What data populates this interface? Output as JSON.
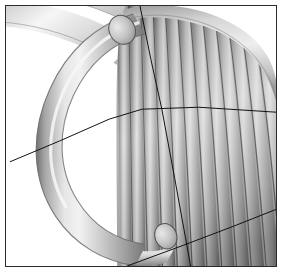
{
  "figure": {
    "render_style": "gouraud-shaded grayscale solid model",
    "background_color": "#ffffff",
    "frame_color": "#2b2b2b",
    "frame_width_px": 1,
    "image_width_px": 284,
    "image_height_px": 274,
    "caption": ""
  },
  "palette": {
    "highlight": "#f2f2f2",
    "light": "#dcdcdc",
    "mid": "#b9b9b9",
    "mid_dark": "#9c9c9c",
    "dark": "#7d7d7d",
    "shadow": "#5e5e5e",
    "groove": "#4a4a4a",
    "outline": "#3a3a3a",
    "wire": "#111111",
    "paper": "#ffffff"
  },
  "geometry": {
    "foreground_ring": {
      "name": "front-coil-turn",
      "description": "large near-circular tube turn sweeping from upper-left, around the left side and back to lower-right",
      "tube_diameter_px": 26,
      "center": {
        "x": 142,
        "y": 132
      },
      "radius_x_px": 92,
      "radius_y_px": 110
    },
    "background_arcs": {
      "name": "rear-coil-turns",
      "description": "two parallel tube arcs crossing the upper-left corner diagonally",
      "count": 2,
      "tube_diameter_px": 24
    },
    "coil_pack": {
      "name": "wound-coil-body",
      "description": "densely packed helical windings filling the right half, seen as near-vertical ribs",
      "rib_count": 16,
      "rib_pitch_px": 14,
      "rib_tube_width_px": 13
    },
    "tube_end_caps": [
      {
        "name": "upper-tube-end-cap",
        "cx": 123,
        "cy": 30,
        "rx": 13,
        "ry": 15,
        "rotation_deg": -28
      },
      {
        "name": "lower-tube-end-cap",
        "cx": 167,
        "cy": 238,
        "rx": 11,
        "ry": 13,
        "rotation_deg": -22
      }
    ],
    "wireframe_lines": [
      {
        "name": "section-line-horizontal",
        "description": "long poly-line sweeping from the left edge up across the model to the right edge",
        "points": "10,163 60,142 110,120 143,110 200,108 278,113"
      },
      {
        "name": "section-line-vertical",
        "description": "near-vertical construction line from the top edge down to the bottom edge",
        "points": "141,6 152,60 163,110 176,180 192,268"
      },
      {
        "name": "section-line-diagonal",
        "description": "diagonal line across the lower right quadrant",
        "points": "128,268 185,247 235,228 278,211"
      }
    ]
  },
  "annotations": {
    "axis_labels": [],
    "scale_bar": null,
    "legend": []
  }
}
